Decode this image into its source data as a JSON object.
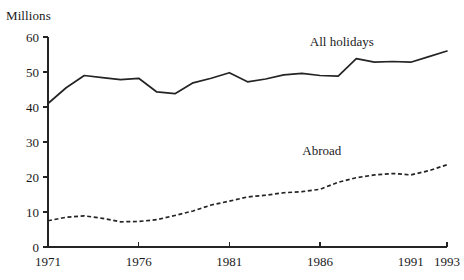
{
  "chart_data": {
    "type": "line",
    "title": "",
    "ylabel": "Millions",
    "xlabel": "",
    "ylim": [
      0,
      60
    ],
    "xlim": [
      1971,
      1993
    ],
    "yticks": [
      0,
      10,
      20,
      30,
      40,
      50,
      60
    ],
    "ytick_labels": [
      "0",
      "10",
      "20",
      "30",
      "40",
      "50",
      "60"
    ],
    "xticks": [
      1971,
      1976,
      1981,
      1986,
      1993
    ],
    "xtick_labels": [
      "1971",
      "1976",
      "1981",
      "1986",
      "1991",
      "1993"
    ],
    "xtick_label_years": [
      1971,
      1976,
      1981,
      1986,
      1991,
      1993
    ],
    "grid": false,
    "legend_position": "inline-annotation",
    "x": [
      1971,
      1972,
      1973,
      1974,
      1975,
      1976,
      1977,
      1978,
      1979,
      1980,
      1981,
      1982,
      1983,
      1984,
      1985,
      1986,
      1987,
      1988,
      1989,
      1990,
      1991,
      1992,
      1993
    ],
    "series": [
      {
        "name": "All holidays",
        "style": "solid",
        "label_x": 1987.2,
        "label_y": 57.5,
        "values": [
          41.0,
          45.5,
          49.0,
          48.4,
          47.8,
          48.2,
          44.3,
          43.8,
          46.9,
          48.2,
          49.8,
          47.2,
          48.0,
          49.2,
          49.6,
          49.0,
          48.8,
          53.8,
          52.8,
          53.0,
          52.8,
          54.4,
          56.0
        ]
      },
      {
        "name": "Abroad",
        "style": "dashed",
        "label_x": 1986.1,
        "label_y": 26.2,
        "values": [
          7.5,
          8.5,
          8.9,
          8.2,
          7.2,
          7.3,
          7.8,
          9.0,
          10.3,
          12.0,
          13.1,
          14.3,
          14.8,
          15.5,
          15.8,
          16.5,
          18.5,
          19.8,
          20.6,
          21.0,
          20.6,
          21.8,
          23.5
        ]
      }
    ]
  }
}
